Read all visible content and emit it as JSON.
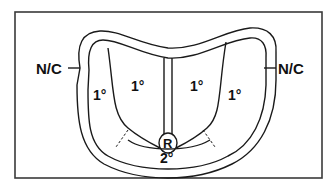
{
  "diagram": {
    "labels": {
      "left_outer": "N/C",
      "right_outer": "N/C",
      "left_lateral": "1°",
      "left_inner": "1°",
      "right_inner": "1°",
      "right_lateral": "1°",
      "center_circle": "R",
      "bottom": "2°"
    },
    "colors": {
      "line": "#1a1a1a",
      "frame": "#3a3a3a",
      "background": "#ffffff"
    }
  }
}
